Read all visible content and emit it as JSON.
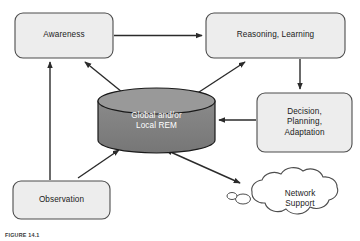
{
  "figure": {
    "caption": "FIGURE 14.1",
    "background_color": "#ffffff",
    "line_color": "#2b2b2b",
    "box_fill": "#ededed",
    "box_stroke": "#4d4d4d",
    "cylinder_body_fill": "#808080",
    "cylinder_top_fill": "#969696",
    "cylinder_stroke": "#1a1a1a",
    "cloud_fill": "#ffffff",
    "cloud_stroke": "#4d4d4d",
    "label_color": "#1b1b1b",
    "label_color_on_dark": "#ffffff"
  },
  "nodes": {
    "awareness": {
      "label": "Awareness",
      "shape": "rounded-rect",
      "x": 15,
      "y": 13,
      "w": 98,
      "h": 45
    },
    "reasoning": {
      "label": "Reasoning, Learning",
      "shape": "rounded-rect",
      "x": 206,
      "y": 13,
      "w": 139,
      "h": 45
    },
    "decision": {
      "label": "Decision,\nPlanning,\nAdaptation",
      "shape": "rounded-rect",
      "x": 257,
      "y": 93,
      "w": 95,
      "h": 59
    },
    "observation": {
      "label": "Observation",
      "shape": "rounded-rect",
      "x": 13,
      "y": 181,
      "w": 97,
      "h": 38
    },
    "repository": {
      "label": "Global and/or\nLocal REM",
      "shape": "cylinder",
      "x": 98,
      "y": 88,
      "w": 117,
      "h": 65
    },
    "network": {
      "label": "Network\nSupport",
      "shape": "cloud",
      "x": 230,
      "y": 172,
      "w": 118,
      "h": 60
    }
  },
  "edges": [
    {
      "name": "awareness-to-reasoning",
      "from": "awareness",
      "to": "reasoning",
      "style": "straight",
      "arrow": "end"
    },
    {
      "name": "reasoning-to-decision",
      "from": "reasoning",
      "to": "decision",
      "style": "straight",
      "arrow": "end"
    },
    {
      "name": "decision-to-repository",
      "from": "decision",
      "to": "repository",
      "style": "straight",
      "arrow": "end"
    },
    {
      "name": "observation-to-awareness",
      "from": "observation",
      "to": "awareness",
      "style": "straight",
      "arrow": "end"
    },
    {
      "name": "observation-to-repository",
      "from": "observation",
      "to": "repository",
      "style": "diagonal",
      "arrow": "end"
    },
    {
      "name": "repository-to-awareness",
      "from": "repository",
      "to": "awareness",
      "style": "diagonal",
      "arrow": "end"
    },
    {
      "name": "repository-to-reasoning",
      "from": "repository",
      "to": "reasoning",
      "style": "diagonal",
      "arrow": "end"
    },
    {
      "name": "repository-to-network",
      "from": "repository",
      "to": "network",
      "style": "diagonal",
      "arrow": "both"
    }
  ]
}
